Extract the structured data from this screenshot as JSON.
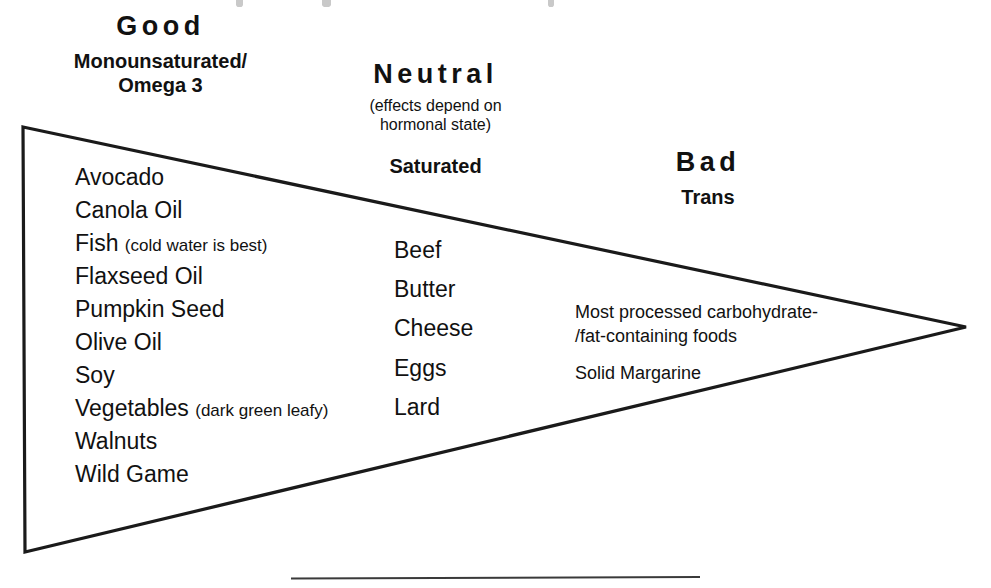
{
  "diagram": {
    "shape": "triangle",
    "stroke_color": "#1a1a1a",
    "background_color": "#ffffff",
    "baseline_rule_color": "#3a3a3a"
  },
  "columns": {
    "good": {
      "heading": "Good",
      "subheading_line1": "Monounsaturated/",
      "subheading_line2": "Omega 3",
      "items": [
        {
          "name": "Avocado",
          "qualifier": ""
        },
        {
          "name": "Canola Oil",
          "qualifier": ""
        },
        {
          "name": "Fish",
          "qualifier": "(cold water is best)"
        },
        {
          "name": "Flaxseed Oil",
          "qualifier": ""
        },
        {
          "name": "Pumpkin Seed",
          "qualifier": ""
        },
        {
          "name": "Olive Oil",
          "qualifier": ""
        },
        {
          "name": "Soy",
          "qualifier": ""
        },
        {
          "name": "Vegetables",
          "qualifier": "(dark green leafy)"
        },
        {
          "name": "Walnuts",
          "qualifier": ""
        },
        {
          "name": "Wild Game",
          "qualifier": ""
        }
      ]
    },
    "neutral": {
      "heading": "Neutral",
      "note_line1": "(effects depend on",
      "note_line2": "hormonal state)",
      "subheading": "Saturated",
      "items": [
        {
          "name": "Beef"
        },
        {
          "name": "Butter"
        },
        {
          "name": "Cheese"
        },
        {
          "name": "Eggs"
        },
        {
          "name": "Lard"
        }
      ]
    },
    "bad": {
      "heading": "Bad",
      "subheading": "Trans",
      "items": [
        {
          "line1": "Most processed carbohydrate-",
          "line2": "/fat-containing foods"
        },
        {
          "line1": "Solid Margarine",
          "line2": ""
        }
      ]
    }
  }
}
